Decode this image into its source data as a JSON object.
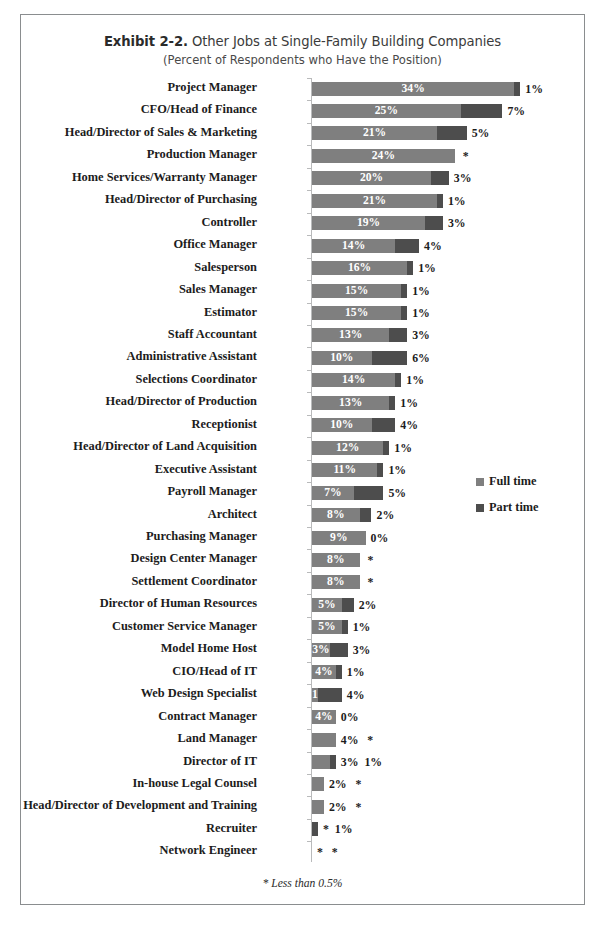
{
  "exhibit": {
    "number": "Exhibit 2-2.",
    "title": "Other Jobs at Single-Family Building Companies",
    "subtitle": "(Percent of Respondents who Have the Position)",
    "footnote": "* Less than 0.5%"
  },
  "legend": {
    "full_label": "Full time",
    "part_label": "Part time",
    "full_color": "#7f7f7f",
    "part_color": "#4d4d4d"
  },
  "chart_data": {
    "type": "bar",
    "orientation": "horizontal",
    "stacked": true,
    "title": "Exhibit 2-2. Other Jobs at Single-Family Building Companies",
    "subtitle": "(Percent of Respondents who Have the Position)",
    "xlabel": "",
    "ylabel": "",
    "xlim": [
      0,
      42
    ],
    "grid": false,
    "legend_position": "right-middle",
    "value_unit": "%",
    "footnote": "* Less than 0.5%",
    "categories": [
      "Project Manager",
      "CFO/Head of Finance",
      "Head/Director of Sales & Marketing",
      "Production Manager",
      "Home Services/Warranty Manager",
      "Head/Director of Purchasing",
      "Controller",
      "Office Manager",
      "Salesperson",
      "Sales Manager",
      "Estimator",
      "Staff Accountant",
      "Administrative Assistant",
      "Selections Coordinator",
      "Head/Director of Production",
      "Receptionist",
      "Head/Director of Land Acquisition",
      "Executive Assistant",
      "Payroll Manager",
      "Architect",
      "Purchasing Manager",
      "Design Center Manager",
      "Settlement Coordinator",
      "Director of Human Resources",
      "Customer Service Manager",
      "Model Home Host",
      "CIO/Head of IT",
      "Web Design Specialist",
      "Contract Manager",
      "Land Manager",
      "Director of IT",
      "In-house Legal Counsel",
      "Head/Director of Development and Training",
      "Recruiter",
      "Network Engineer"
    ],
    "series": [
      {
        "name": "Full time",
        "color": "#7f7f7f",
        "values": [
          34,
          25,
          21,
          24,
          20,
          21,
          19,
          14,
          16,
          15,
          15,
          13,
          10,
          14,
          13,
          10,
          12,
          11,
          7,
          8,
          9,
          8,
          8,
          5,
          5,
          3,
          4,
          1,
          4,
          4,
          3,
          2,
          2,
          0,
          0
        ],
        "labels": [
          "34%",
          "25%",
          "21%",
          "24%",
          "20%",
          "21%",
          "19%",
          "14%",
          "16%",
          "15%",
          "15%",
          "13%",
          "10%",
          "14%",
          "13%",
          "10%",
          "12%",
          "11%",
          "7%",
          "8%",
          "9%",
          "8%",
          "8%",
          "5%",
          "5%",
          "3%",
          "4%",
          "1%",
          "4%",
          "4%",
          "3%",
          "2%",
          "2%",
          "*",
          "*"
        ]
      },
      {
        "name": "Part time",
        "color": "#4d4d4d",
        "values": [
          1,
          7,
          5,
          0,
          3,
          1,
          3,
          4,
          1,
          1,
          1,
          3,
          6,
          1,
          1,
          4,
          1,
          1,
          5,
          2,
          0,
          0,
          0,
          2,
          1,
          3,
          1,
          4,
          0,
          0,
          1,
          0,
          0,
          1,
          0
        ],
        "labels": [
          "1%",
          "7%",
          "5%",
          "*",
          "3%",
          "1%",
          "3%",
          "4%",
          "1%",
          "1%",
          "1%",
          "3%",
          "6%",
          "1%",
          "1%",
          "4%",
          "1%",
          "1%",
          "5%",
          "2%",
          "0%",
          "*",
          "*",
          "2%",
          "1%",
          "3%",
          "1%",
          "4%",
          "0%",
          "*",
          "1%",
          "*",
          "*",
          "1%",
          "*"
        ]
      }
    ]
  },
  "rows": [
    {
      "cat": "Project Manager",
      "full": 34,
      "part": 1,
      "fullLabel": "34%",
      "partLabel": "1%",
      "fullInside": true,
      "partInside": false
    },
    {
      "cat": "CFO/Head of Finance",
      "full": 25,
      "part": 7,
      "fullLabel": "25%",
      "partLabel": "7%",
      "fullInside": true,
      "partInside": false
    },
    {
      "cat": "Head/Director of Sales & Marketing",
      "full": 21,
      "part": 5,
      "fullLabel": "21%",
      "partLabel": "5%",
      "fullInside": true,
      "partInside": false
    },
    {
      "cat": "Production Manager",
      "full": 24,
      "part": 0,
      "fullLabel": "24%",
      "partLabel": "*",
      "fullInside": true,
      "partInside": false
    },
    {
      "cat": "Home Services/Warranty Manager",
      "full": 20,
      "part": 3,
      "fullLabel": "20%",
      "partLabel": "3%",
      "fullInside": true,
      "partInside": false
    },
    {
      "cat": "Head/Director of Purchasing",
      "full": 21,
      "part": 1,
      "fullLabel": "21%",
      "partLabel": "1%",
      "fullInside": true,
      "partInside": false
    },
    {
      "cat": "Controller",
      "full": 19,
      "part": 3,
      "fullLabel": "19%",
      "partLabel": "3%",
      "fullInside": true,
      "partInside": false
    },
    {
      "cat": "Office Manager",
      "full": 14,
      "part": 4,
      "fullLabel": "14%",
      "partLabel": "4%",
      "fullInside": true,
      "partInside": false
    },
    {
      "cat": "Salesperson",
      "full": 16,
      "part": 1,
      "fullLabel": "16%",
      "partLabel": "1%",
      "fullInside": true,
      "partInside": false
    },
    {
      "cat": "Sales Manager",
      "full": 15,
      "part": 1,
      "fullLabel": "15%",
      "partLabel": "1%",
      "fullInside": true,
      "partInside": false
    },
    {
      "cat": "Estimator",
      "full": 15,
      "part": 1,
      "fullLabel": "15%",
      "partLabel": "1%",
      "fullInside": true,
      "partInside": false
    },
    {
      "cat": "Staff Accountant",
      "full": 13,
      "part": 3,
      "fullLabel": "13%",
      "partLabel": "3%",
      "fullInside": true,
      "partInside": false
    },
    {
      "cat": "Administrative Assistant",
      "full": 10,
      "part": 6,
      "fullLabel": "10%",
      "partLabel": "6%",
      "fullInside": true,
      "partInside": false
    },
    {
      "cat": "Selections Coordinator",
      "full": 14,
      "part": 1,
      "fullLabel": "14%",
      "partLabel": "1%",
      "fullInside": true,
      "partInside": false
    },
    {
      "cat": "Head/Director of Production",
      "full": 13,
      "part": 1,
      "fullLabel": "13%",
      "partLabel": "1%",
      "fullInside": true,
      "partInside": false
    },
    {
      "cat": "Receptionist",
      "full": 10,
      "part": 4,
      "fullLabel": "10%",
      "partLabel": "4%",
      "fullInside": true,
      "partInside": false
    },
    {
      "cat": "Head/Director of Land Acquisition",
      "full": 12,
      "part": 1,
      "fullLabel": "12%",
      "partLabel": "1%",
      "fullInside": true,
      "partInside": false
    },
    {
      "cat": "Executive Assistant",
      "full": 11,
      "part": 1,
      "fullLabel": "11%",
      "partLabel": "1%",
      "fullInside": true,
      "partInside": false
    },
    {
      "cat": "Payroll Manager",
      "full": 7,
      "part": 5,
      "fullLabel": "7%",
      "partLabel": "5%",
      "fullInside": true,
      "partInside": false
    },
    {
      "cat": "Architect",
      "full": 8,
      "part": 2,
      "fullLabel": "8%",
      "partLabel": "2%",
      "fullInside": true,
      "partInside": false
    },
    {
      "cat": "Purchasing Manager",
      "full": 9,
      "part": 0,
      "fullLabel": "9%",
      "partLabel": "0%",
      "fullInside": true,
      "partInside": false
    },
    {
      "cat": "Design Center Manager",
      "full": 8,
      "part": 0,
      "fullLabel": "8%",
      "partLabel": "*",
      "fullInside": true,
      "partInside": false
    },
    {
      "cat": "Settlement Coordinator",
      "full": 8,
      "part": 0,
      "fullLabel": "8%",
      "partLabel": "*",
      "fullInside": true,
      "partInside": false
    },
    {
      "cat": "Director of Human Resources",
      "full": 5,
      "part": 2,
      "fullLabel": "5%",
      "partLabel": "2%",
      "fullInside": true,
      "partInside": false
    },
    {
      "cat": "Customer Service Manager",
      "full": 5,
      "part": 1,
      "fullLabel": "5%",
      "partLabel": "1%",
      "fullInside": true,
      "partInside": false
    },
    {
      "cat": "Model Home Host",
      "full": 3,
      "part": 3,
      "fullLabel": "3%",
      "partLabel": "3%",
      "fullInside": true,
      "partInside": false
    },
    {
      "cat": "CIO/Head of IT",
      "full": 4,
      "part": 1,
      "fullLabel": "4%",
      "partLabel": "1%",
      "fullInside": true,
      "partInside": false
    },
    {
      "cat": "Web Design Specialist",
      "full": 1,
      "part": 4,
      "fullLabel": "1%",
      "partLabel": "4%",
      "fullInside": true,
      "partInside": false
    },
    {
      "cat": "Contract Manager",
      "full": 4,
      "part": 0,
      "fullLabel": "4%",
      "partLabel": "0%",
      "fullInside": true,
      "partInside": false
    },
    {
      "cat": "Land Manager",
      "full": 4,
      "part": 0,
      "fullLabel": "4%",
      "partLabel": "*",
      "fullInside": false,
      "partInside": false
    },
    {
      "cat": "Director of IT",
      "full": 3,
      "part": 1,
      "fullLabel": "3%",
      "partLabel": "1%",
      "fullInside": false,
      "partInside": false
    },
    {
      "cat": "In-house Legal Counsel",
      "full": 2,
      "part": 0,
      "fullLabel": "2%",
      "partLabel": "*",
      "fullInside": false,
      "partInside": false
    },
    {
      "cat": "Head/Director of Development and Training",
      "full": 2,
      "part": 0,
      "fullLabel": "2%",
      "partLabel": "*",
      "fullInside": false,
      "partInside": false
    },
    {
      "cat": "Recruiter",
      "full": 0,
      "part": 1,
      "fullLabel": "*",
      "partLabel": "1%",
      "fullInside": false,
      "partInside": false
    },
    {
      "cat": "Network Engineer",
      "full": 0,
      "part": 0,
      "fullLabel": "*",
      "partLabel": "*",
      "fullInside": false,
      "partInside": false
    }
  ]
}
